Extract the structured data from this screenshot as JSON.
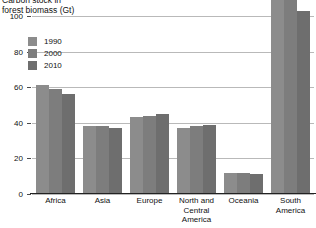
{
  "chart_data": {
    "type": "bar",
    "title": "Carbon stock in\nforest biomass (Gt)",
    "xlabel": "",
    "ylabel": "",
    "ylim": [
      0,
      100
    ],
    "yticks": [
      0,
      20,
      40,
      60,
      80,
      100
    ],
    "ytick_labels": [
      "0",
      "20",
      "40",
      "60",
      "80",
      "100"
    ],
    "grid": true,
    "legend_position": "upper-left-inside",
    "categories": [
      "Africa",
      "Asia",
      "Europe",
      "North and\nCentral America",
      "Oceania",
      "South\nAmerica"
    ],
    "series": [
      {
        "name": "1990",
        "color": "#8c8c8c",
        "values": [
          61,
          38,
          43,
          37,
          12,
          115
        ]
      },
      {
        "name": "2000",
        "color": "#7d7d7d",
        "values": [
          59,
          38,
          44,
          38,
          12,
          110
        ]
      },
      {
        "name": "2010",
        "color": "#6e6e6e",
        "values": [
          56,
          37,
          45,
          39,
          11,
          103
        ]
      }
    ]
  },
  "axis": {
    "line_color": "#222222",
    "grid_color": "#b9b9b9"
  }
}
